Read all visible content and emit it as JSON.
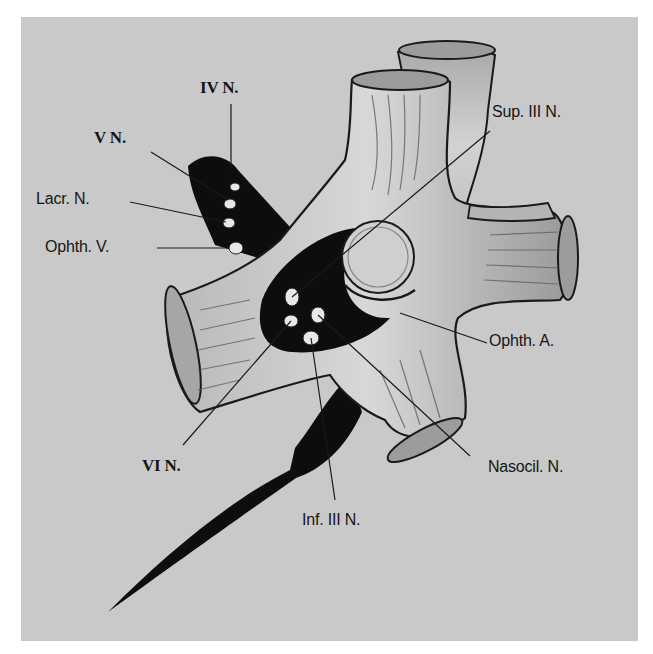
{
  "figure": {
    "background_color": "#c9c9c9",
    "labels": {
      "iv_n": "IV N.",
      "v_n": "V N.",
      "lacr_n": "Lacr. N.",
      "ophth_v": "Ophth. V.",
      "sup_iii_n": "Sup. III N.",
      "ophth_a": "Ophth. A.",
      "vi_n": "VI N.",
      "nasocil_n": "Nasocil. N.",
      "inf_iii_n": "Inf. III N."
    }
  }
}
